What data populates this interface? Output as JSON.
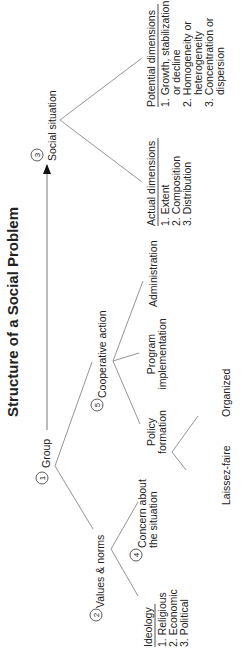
{
  "diagram": {
    "title": "Structure of a Social Problem",
    "nodes": {
      "group": {
        "num": "1",
        "label": "Group"
      },
      "values": {
        "num": "2",
        "label": "Values & norms"
      },
      "social": {
        "num": "3",
        "label": "Social situation"
      },
      "concern": {
        "num": "4",
        "line1": "Concern about",
        "line2": "the situation"
      },
      "coop": {
        "num": "5",
        "label": "Cooperative action"
      },
      "policy": {
        "line1": "Policy",
        "line2": "formation"
      },
      "program": {
        "line1": "Program",
        "line2": "implementation"
      },
      "admin": {
        "label": "Administration"
      },
      "laissez": {
        "label": "Laissez-faire"
      },
      "organized": {
        "label": "Organized"
      },
      "ideology": {
        "heading": "Ideology",
        "items": [
          "1. Religious",
          "2. Economic",
          "3. Political"
        ]
      },
      "actual": {
        "heading": "Actual dimensions",
        "items": [
          "1. Extent",
          "2. Composition",
          "3. Distribution"
        ]
      },
      "potential": {
        "heading": "Potential dimensions",
        "items": [
          "1. Growth, stabilization,",
          "or decline",
          "2. Homogeneity or",
          "heterogeneity",
          "3. Concentration or",
          "dispersion"
        ]
      }
    }
  }
}
